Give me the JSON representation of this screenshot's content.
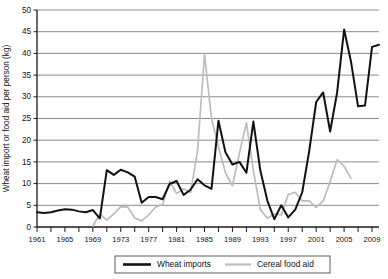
{
  "chart_data": {
    "type": "line",
    "title": "",
    "xlabel": "",
    "ylabel": "Wheat import or food aid per person (kg)",
    "ylim": [
      0,
      50
    ],
    "xlim": [
      1961,
      2010
    ],
    "y_ticks": [
      0,
      5,
      10,
      15,
      20,
      25,
      30,
      35,
      40,
      45,
      50
    ],
    "x_ticks": [
      1961,
      1963,
      1965,
      1967,
      1969,
      1971,
      1973,
      1975,
      1977,
      1979,
      1981,
      1983,
      1985,
      1987,
      1989,
      1991,
      1993,
      1995,
      1997,
      1999,
      2001,
      2003,
      2005,
      2007,
      2009
    ],
    "x_tick_labels": [
      "1961",
      "",
      "1965",
      "",
      "1969",
      "",
      "1973",
      "",
      "1977",
      "",
      "1981",
      "",
      "1985",
      "",
      "1989",
      "",
      "1993",
      "",
      "1997",
      "",
      "2001",
      "",
      "2005",
      "",
      "2009"
    ],
    "grid": "horizontal",
    "legend_position": "bottom",
    "colors": {
      "wheat_imports": "#111111",
      "cereal_food_aid": "#bcbcbc"
    },
    "series": [
      {
        "name": "Wheat imports",
        "color": "#111111",
        "x": [
          1961,
          1962,
          1963,
          1964,
          1965,
          1966,
          1967,
          1968,
          1969,
          1970,
          1971,
          1972,
          1973,
          1974,
          1975,
          1976,
          1977,
          1978,
          1979,
          1980,
          1981,
          1982,
          1983,
          1984,
          1985,
          1986,
          1987,
          1988,
          1989,
          1990,
          1991,
          1992,
          1993,
          1994,
          1995,
          1996,
          1997,
          1998,
          1999,
          2000,
          2001,
          2002,
          2003,
          2004,
          2005,
          2006,
          2007,
          2008,
          2009,
          2010
        ],
        "values": [
          3.4,
          3.2,
          3.4,
          3.8,
          4.1,
          4.0,
          3.6,
          3.4,
          3.9,
          2.0,
          13.1,
          12.0,
          13.2,
          12.6,
          11.6,
          5.6,
          6.9,
          6.9,
          6.4,
          9.9,
          10.6,
          7.4,
          8.6,
          11.0,
          9.6,
          8.8,
          24.5,
          17.2,
          14.4,
          15.0,
          12.5,
          24.3,
          13.0,
          6.1,
          1.8,
          5.0,
          2.2,
          4.0,
          8.0,
          17.5,
          28.8,
          31.0,
          22.0,
          31.0,
          45.5,
          38.0,
          27.8,
          28.0,
          41.5,
          42.0
        ]
      },
      {
        "name": "Cereal food aid",
        "color": "#bcbcbc",
        "x": [
          1969,
          1970,
          1971,
          1972,
          1973,
          1974,
          1975,
          1976,
          1977,
          1978,
          1979,
          1980,
          1981,
          1982,
          1983,
          1984,
          1985,
          1986,
          1987,
          1988,
          1989,
          1990,
          1991,
          1992,
          1993,
          1994,
          1995,
          1996,
          1997,
          1998,
          1999,
          2000,
          2001,
          2002,
          2003,
          2004,
          2005,
          2006
        ],
        "values": [
          0.2,
          3.0,
          1.6,
          3.0,
          4.7,
          4.6,
          2.1,
          1.4,
          2.8,
          4.6,
          5.2,
          10.6,
          7.7,
          8.8,
          8.0,
          17.5,
          39.8,
          25.0,
          18.5,
          12.5,
          9.5,
          17.0,
          24.0,
          13.0,
          4.0,
          2.0,
          3.0,
          2.8,
          7.5,
          8.0,
          6.0,
          6.0,
          4.5,
          6.0,
          10.5,
          15.5,
          14.0,
          11.2
        ]
      }
    ]
  },
  "legend": {
    "items": [
      {
        "label": "Wheat imports",
        "color": "#111111"
      },
      {
        "label": "Cereal food aid",
        "color": "#bcbcbc"
      }
    ]
  }
}
